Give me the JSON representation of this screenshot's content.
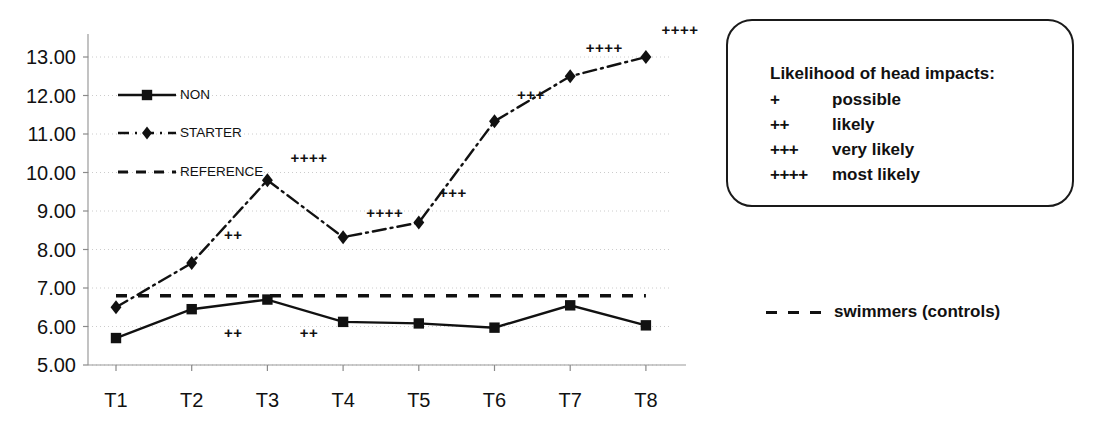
{
  "chart_data": {
    "type": "line",
    "title": "",
    "xlabel": "",
    "ylabel": "",
    "categories": [
      "T1",
      "T2",
      "T3",
      "T4",
      "T5",
      "T6",
      "T7",
      "T8"
    ],
    "ylim": [
      5.0,
      13.6
    ],
    "yticks": [
      "5.00",
      "6.00",
      "7.00",
      "8.00",
      "9.00",
      "10.00",
      "11.00",
      "12.00",
      "13.00"
    ],
    "ytick_values": [
      5,
      6,
      7,
      8,
      9,
      10,
      11,
      12,
      13
    ],
    "grid": true,
    "legend_position": "inside-upper-left",
    "series": [
      {
        "name": "NON",
        "style": "solid",
        "marker": "square",
        "values": [
          5.7,
          6.45,
          6.7,
          6.12,
          6.08,
          5.97,
          6.55,
          6.03
        ]
      },
      {
        "name": "STARTER",
        "style": "dash-dot",
        "marker": "diamond",
        "values": [
          6.5,
          7.65,
          9.8,
          8.32,
          8.7,
          11.33,
          12.5,
          13.0
        ]
      },
      {
        "name": "REFERENCE",
        "style": "dashed",
        "marker": "none",
        "constant": 6.8,
        "values": [
          6.8,
          6.8,
          6.8,
          6.8,
          6.8,
          6.8,
          6.8,
          6.8
        ]
      }
    ],
    "annotations": [
      {
        "text": "++",
        "x": 1.55,
        "y": 8.4
      },
      {
        "text": "++",
        "x": 1.55,
        "y": 5.85
      },
      {
        "text": "++++",
        "x": 2.55,
        "y": 10.4
      },
      {
        "text": "++",
        "x": 2.55,
        "y": 5.85
      },
      {
        "text": "++++",
        "x": 3.55,
        "y": 8.98
      },
      {
        "text": "+++",
        "x": 4.45,
        "y": 9.5
      },
      {
        "text": "+++",
        "x": 5.48,
        "y": 12.05
      },
      {
        "text": "++++",
        "x": 6.45,
        "y": 13.25
      },
      {
        "text": "++++",
        "x": 7.45,
        "y": 13.72
      }
    ]
  },
  "inline_legend": {
    "items": [
      {
        "label": "NON",
        "style": "solid",
        "marker": "square"
      },
      {
        "label": "STARTER",
        "style": "dash-dot",
        "marker": "diamond"
      },
      {
        "label": "REFERENCE",
        "style": "dashed",
        "marker": "none"
      }
    ]
  },
  "legend_box": {
    "title": "Likelihood of head impacts:",
    "rows": [
      {
        "symbol": "+",
        "meaning": "possible"
      },
      {
        "symbol": "++",
        "meaning": "likely"
      },
      {
        "symbol": "+++",
        "meaning": "very likely"
      },
      {
        "symbol": "++++",
        "meaning": "most likely"
      }
    ]
  },
  "swimmers_note": {
    "label": "swimmers (controls)",
    "line_style": "dashed"
  },
  "colors": {
    "ink": "#111111",
    "grid": "#cccccc",
    "background": "#ffffff"
  }
}
